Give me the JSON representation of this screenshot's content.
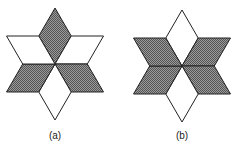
{
  "figures": [
    {
      "label": "(a)",
      "center": [
        55,
        64
      ],
      "radius": 56,
      "shaded_rhombi": [
        "top",
        "lower-left",
        "lower-right"
      ],
      "unshaded_rhombi": [
        "upper-left",
        "upper-right",
        "bottom"
      ]
    },
    {
      "label": "(b)",
      "center": [
        182,
        66
      ],
      "radius": 56,
      "shaded_rhombi": [
        "upper-left",
        "upper-right",
        "lower-left",
        "lower-right"
      ],
      "unshaded_rhombi": [
        "top",
        "bottom"
      ]
    }
  ],
  "colors": {
    "shade": "#7a7a7a",
    "stroke": "#222222",
    "fill": "#ffffff"
  }
}
